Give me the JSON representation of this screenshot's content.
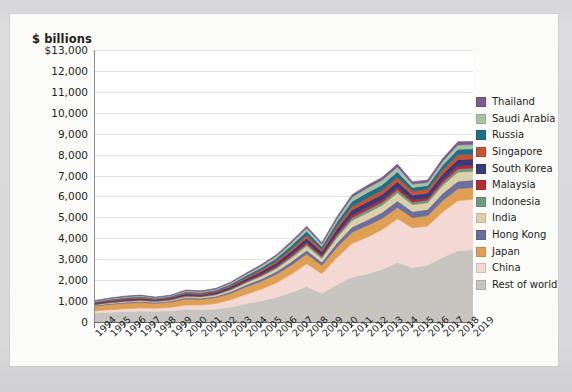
{
  "chart_data": {
    "type": "area",
    "stacked": true,
    "title": "",
    "subtitle": "",
    "unit_label": "$ billions",
    "xlabel": "",
    "ylabel": "$ billions",
    "ylim": [
      0,
      13000
    ],
    "ytick_values": [
      0,
      1000,
      2000,
      3000,
      4000,
      5000,
      6000,
      7000,
      8000,
      9000,
      10000,
      11000,
      12000,
      13000
    ],
    "ytick_labels": [
      "0",
      "1,000",
      "2,000",
      "3,000",
      "4,000",
      "5,000",
      "6,000",
      "7,000",
      "8,000",
      "9,000",
      "10,000",
      "11,000",
      "12,000",
      "$13,000"
    ],
    "grid": "horizontal",
    "legend_position": "right",
    "categories": [
      "1994",
      "1995",
      "1996",
      "1997",
      "1998",
      "1999",
      "2000",
      "2001",
      "2002",
      "2003",
      "2004",
      "2005",
      "2006",
      "2007",
      "2008",
      "2009",
      "2010",
      "2011",
      "2012",
      "2013",
      "2014",
      "2015",
      "2016",
      "2017",
      "2018",
      "2019"
    ],
    "stack_order_bottom_to_top": [
      "Rest of world",
      "China",
      "Japan",
      "Hong Kong",
      "India",
      "Indonesia",
      "Malaysia",
      "South Korea",
      "Singapore",
      "Russia",
      "Saudi Arabia",
      "Thailand"
    ],
    "series": [
      {
        "name": "Rest of world",
        "color": "#c8c4c0",
        "values": [
          430,
          470,
          500,
          520,
          510,
          540,
          610,
          590,
          620,
          720,
          880,
          1010,
          1180,
          1420,
          1700,
          1380,
          1780,
          2150,
          2300,
          2520,
          2850,
          2600,
          2720,
          3100,
          3400,
          3450
        ]
      },
      {
        "name": "China",
        "color": "#f3d8d4",
        "values": [
          105,
          120,
          135,
          150,
          150,
          160,
          200,
          220,
          270,
          350,
          450,
          560,
          700,
          880,
          1080,
          930,
          1300,
          1600,
          1750,
          1900,
          2080,
          1900,
          1870,
          2170,
          2400,
          2420
        ]
      },
      {
        "name": "Japan",
        "color": "#e0a054",
        "values": [
          220,
          250,
          260,
          260,
          230,
          250,
          290,
          270,
          280,
          310,
          350,
          380,
          400,
          430,
          470,
          400,
          490,
          540,
          560,
          530,
          540,
          480,
          490,
          540,
          570,
          560
        ]
      },
      {
        "name": "Hong Kong",
        "color": "#6b6f9e",
        "values": [
          40,
          45,
          50,
          55,
          50,
          55,
          65,
          60,
          65,
          80,
          95,
          110,
          130,
          160,
          180,
          150,
          210,
          250,
          270,
          290,
          320,
          300,
          300,
          340,
          360,
          360
        ]
      },
      {
        "name": "India",
        "color": "#dcd0ab",
        "values": [
          25,
          30,
          32,
          35,
          35,
          40,
          50,
          50,
          58,
          72,
          95,
          115,
          140,
          175,
          200,
          180,
          250,
          310,
          330,
          340,
          370,
          320,
          320,
          380,
          430,
          420
        ]
      },
      {
        "name": "Indonesia",
        "color": "#6f9a7e",
        "values": [
          22,
          25,
          28,
          30,
          24,
          26,
          32,
          31,
          33,
          40,
          48,
          58,
          68,
          80,
          95,
          80,
          105,
          130,
          140,
          140,
          145,
          120,
          120,
          140,
          155,
          150
        ]
      },
      {
        "name": "Malaysia",
        "color": "#b72a33",
        "values": [
          23,
          27,
          30,
          31,
          26,
          28,
          37,
          34,
          36,
          42,
          50,
          58,
          66,
          78,
          90,
          75,
          100,
          120,
          125,
          126,
          128,
          110,
          110,
          128,
          140,
          135
        ]
      },
      {
        "name": "South Korea",
        "color": "#3a3a7a",
        "values": [
          45,
          50,
          55,
          54,
          45,
          55,
          70,
          65,
          70,
          85,
          105,
          120,
          140,
          165,
          190,
          160,
          210,
          250,
          260,
          260,
          270,
          240,
          240,
          280,
          310,
          300
        ]
      },
      {
        "name": "Singapore",
        "color": "#cc5130",
        "values": [
          35,
          40,
          45,
          45,
          38,
          42,
          55,
          50,
          53,
          62,
          75,
          88,
          105,
          125,
          145,
          118,
          155,
          185,
          195,
          198,
          205,
          180,
          180,
          210,
          230,
          225
        ]
      },
      {
        "name": "Russia",
        "color": "#1f6f86",
        "values": [
          30,
          34,
          38,
          40,
          32,
          30,
          42,
          44,
          48,
          60,
          78,
          98,
          120,
          155,
          185,
          130,
          180,
          230,
          250,
          260,
          270,
          180,
          170,
          220,
          260,
          255
        ]
      },
      {
        "name": "Saudi Arabia",
        "color": "#a9c2a6",
        "values": [
          32,
          35,
          38,
          40,
          30,
          34,
          48,
          44,
          45,
          55,
          70,
          88,
          105,
          125,
          155,
          110,
          150,
          200,
          220,
          225,
          235,
          160,
          150,
          180,
          210,
          205
        ]
      },
      {
        "name": "Thailand",
        "color": "#7a5c8e",
        "values": [
          22,
          25,
          27,
          27,
          21,
          24,
          32,
          30,
          32,
          40,
          48,
          58,
          66,
          80,
          92,
          76,
          100,
          120,
          128,
          130,
          135,
          115,
          115,
          135,
          150,
          148
        ]
      }
    ],
    "legend_entries": [
      {
        "label": "Thailand",
        "color": "#7a5c8e"
      },
      {
        "label": "Saudi Arabia",
        "color": "#a9c2a6"
      },
      {
        "label": "Russia",
        "color": "#1f6f86"
      },
      {
        "label": "Singapore",
        "color": "#cc5130"
      },
      {
        "label": "South Korea",
        "color": "#3a3a7a"
      },
      {
        "label": "Malaysia",
        "color": "#b72a33"
      },
      {
        "label": "Indonesia",
        "color": "#6f9a7e"
      },
      {
        "label": "India",
        "color": "#dcd0ab"
      },
      {
        "label": "Hong Kong",
        "color": "#6b6f9e"
      },
      {
        "label": "Japan",
        "color": "#e0a054"
      },
      {
        "label": "China",
        "color": "#f3d8d4"
      },
      {
        "label": "Rest of world",
        "color": "#c8c4c0"
      }
    ],
    "annotations": [],
    "notes": {
      "peak_year": "2014",
      "peak_value": 12100,
      "dip_year": "2009"
    }
  }
}
